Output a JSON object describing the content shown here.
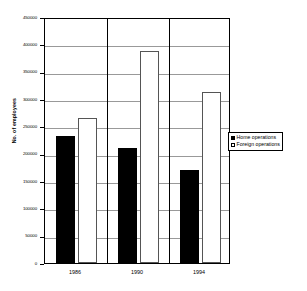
{
  "chart_data": {
    "type": "bar",
    "title": "",
    "xlabel": "",
    "ylabel": "No. of employees",
    "categories": [
      "1986",
      "1990",
      "1994"
    ],
    "series": [
      {
        "name": "Home operations",
        "color": "#000000",
        "values": [
          232000,
          211000,
          171000
        ]
      },
      {
        "name": "Foreign operations",
        "color": "#ffffff",
        "values": [
          266000,
          387000,
          312000
        ]
      }
    ],
    "ylim": [
      0,
      450000
    ],
    "ytick_step": 50000,
    "ytick_labels": [
      "450000",
      "400000",
      "350000",
      "300000",
      "250000",
      "200000",
      "150000",
      "100000",
      "50000",
      "0"
    ],
    "grid": true,
    "legend_position": "right"
  },
  "legend": {
    "items": [
      {
        "label": "Home operations",
        "swatch": "filled-square"
      },
      {
        "label": "Foreign operations",
        "swatch": "empty-square"
      }
    ]
  }
}
